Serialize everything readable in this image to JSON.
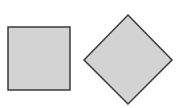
{
  "canvas": {
    "width": 180,
    "height": 108,
    "background": "#ffffff"
  },
  "shapes": [
    {
      "type": "square",
      "x": 8,
      "y": 27,
      "width": 62,
      "height": 63,
      "fill": "#d3d3d3",
      "stroke": "#3a3a3a"
    },
    {
      "type": "diamond",
      "points": [
        [
          128,
          15
        ],
        [
          172,
          60
        ],
        [
          128,
          104
        ],
        [
          84,
          60
        ]
      ],
      "fill": "#d3d3d3",
      "stroke": "#3a3a3a"
    }
  ]
}
